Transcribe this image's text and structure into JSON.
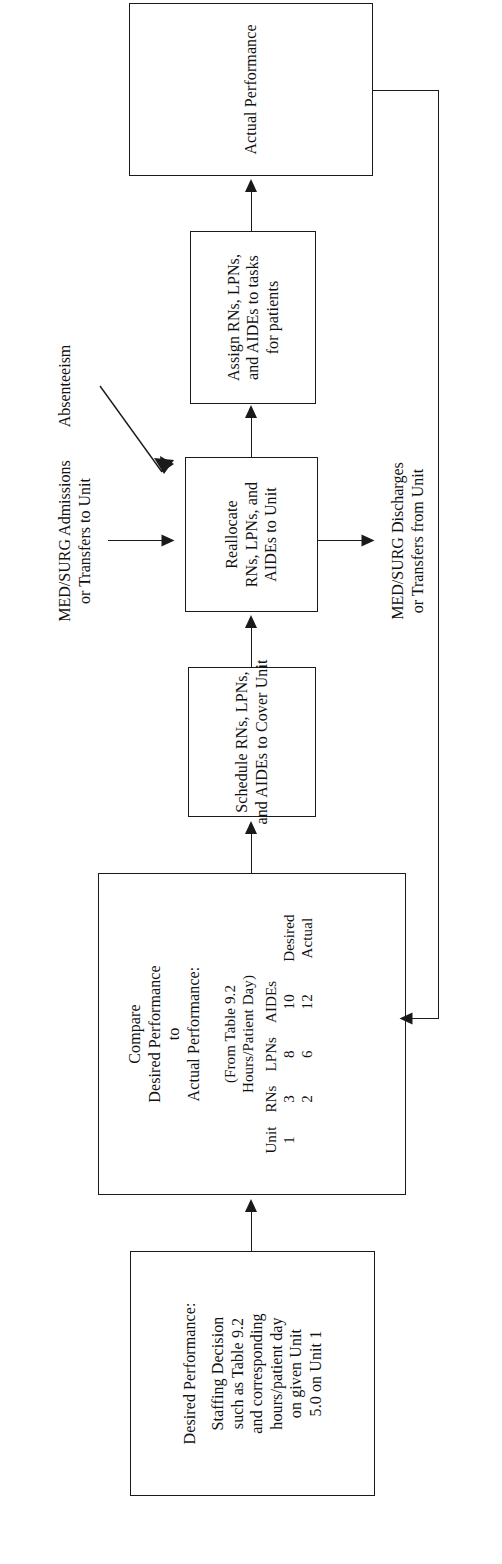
{
  "diagram": {
    "orientation": "rotated-90-ccw",
    "line_color": "#1a1a1a",
    "background_color": "#ffffff"
  },
  "nodes": {
    "desired_performance": {
      "lines": [
        "Desired Performance:",
        "Staffing Decision",
        "such as Table 9.2",
        "and corresponding",
        "hours/patient day",
        "on given Unit",
        "5.0 on Unit 1"
      ]
    },
    "compare": {
      "header_lines": [
        "Compare",
        "Desired Performance",
        "to",
        "Actual Performance:"
      ],
      "source_lines": [
        "(From Table 9.2",
        "Hours/Patient Day)"
      ],
      "table": {
        "columns": [
          "Unit",
          "RNs",
          "LPNs",
          "AIDEs",
          ""
        ],
        "rows": [
          [
            "1",
            "3",
            "8",
            "10",
            "Desired"
          ],
          [
            "",
            "2",
            "6",
            "12",
            "Actual"
          ]
        ]
      }
    },
    "schedule": {
      "lines": [
        "Schedule RNs, LPNs,",
        "and AIDEs to Cover Unit"
      ]
    },
    "reallocate": {
      "lines": [
        "Reallocate",
        "RNs, LPNs, and",
        "AIDEs to Unit"
      ]
    },
    "assign": {
      "lines": [
        "Assign RNs, LPNs,",
        "and AIDEs to tasks",
        "for patients"
      ]
    },
    "actual_performance": {
      "lines": [
        "Actual Performance"
      ]
    }
  },
  "annotations": {
    "admissions": {
      "lines": [
        "MED/SURG Admissions",
        "or Transfers to Unit"
      ]
    },
    "absenteeism": {
      "lines": [
        "Absenteeism"
      ]
    },
    "discharges": {
      "lines": [
        "MED/SURG Discharges",
        "or Transfers from Unit"
      ]
    }
  },
  "connectors": [
    {
      "name": "desired-to-compare",
      "from": "desired_performance",
      "to": "compare",
      "style": "solid-arrow"
    },
    {
      "name": "compare-to-schedule",
      "from": "compare",
      "to": "schedule",
      "style": "solid-arrow"
    },
    {
      "name": "schedule-to-reallocate",
      "from": "schedule",
      "to": "reallocate",
      "style": "solid-arrow"
    },
    {
      "name": "reallocate-to-assign",
      "from": "reallocate",
      "to": "assign",
      "style": "solid-arrow"
    },
    {
      "name": "assign-to-actual",
      "from": "assign",
      "to": "actual_performance",
      "style": "solid-arrow"
    },
    {
      "name": "actual-feedback-to-compare",
      "from": "actual_performance",
      "to": "compare",
      "style": "feedback-loop"
    },
    {
      "name": "admissions-into-reallocate",
      "from": "admissions",
      "to": "reallocate",
      "style": "solid-arrow"
    },
    {
      "name": "absenteeism-into-reallocate",
      "from": "absenteeism",
      "to": "reallocate",
      "style": "diagonal-arrow"
    },
    {
      "name": "reallocate-to-discharges",
      "from": "reallocate",
      "to": "discharges",
      "style": "solid-arrow"
    }
  ]
}
